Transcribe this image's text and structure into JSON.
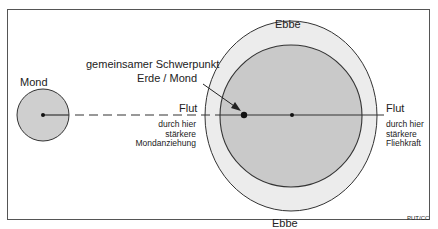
{
  "labels": {
    "moon": "Mond",
    "barycenter_line1": "gemeinsamer Schwerpunkt",
    "barycenter_line2": "Erde / Mond",
    "ebb_top": "Ebbe",
    "ebb_bottom": "Ebbe",
    "flood_left": "Flut",
    "flood_right": "Flut",
    "left_note": [
      "durch hier",
      "stärkere",
      "Mondanziehung"
    ],
    "right_note": [
      "durch hier",
      "stärkere",
      "Fliehkraft"
    ],
    "credit": "PUT/CC"
  },
  "colors": {
    "moon_fill": "#cfcfcf",
    "earth_fill": "#c9c9c9",
    "tide_fill": "#ececec",
    "stroke": "#333333",
    "frame": "#555555"
  }
}
